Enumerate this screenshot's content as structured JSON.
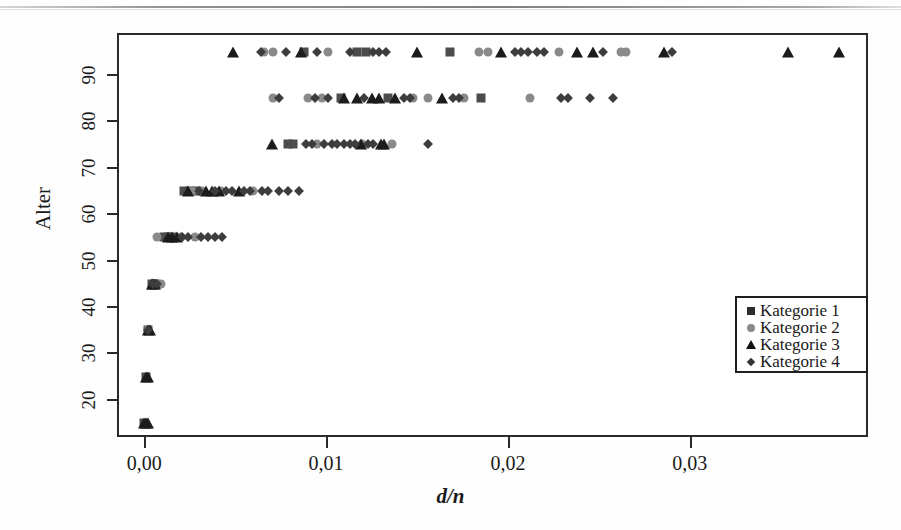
{
  "chart_data": {
    "type": "scatter",
    "title": "",
    "xlabel": "d/n",
    "ylabel": "Alter",
    "xlim": [
      -0.0015,
      0.0398
    ],
    "ylim": [
      12,
      99
    ],
    "grid": false,
    "legend_position": "right-bottom",
    "x_ticks": [
      0.0,
      0.01,
      0.02,
      0.03
    ],
    "x_tick_labels": [
      "0,00",
      "0,01",
      "0,02",
      "0,03"
    ],
    "y_ticks": [
      20,
      30,
      40,
      50,
      60,
      70,
      80,
      90
    ],
    "y_tick_labels": [
      "20",
      "30",
      "40",
      "50",
      "60",
      "70",
      "80",
      "90"
    ],
    "series": [
      {
        "name": "Kategorie 1",
        "marker": "square",
        "color": "#4c4c4c",
        "points": [
          [
            0.0,
            15
          ],
          [
            0.0001,
            25
          ],
          [
            0.0002,
            35
          ],
          [
            0.0004,
            45
          ],
          [
            0.0006,
            45
          ],
          [
            0.0011,
            55
          ],
          [
            0.0013,
            55
          ],
          [
            0.0016,
            55
          ],
          [
            0.0022,
            65
          ],
          [
            0.0025,
            65
          ],
          [
            0.0029,
            65
          ],
          [
            0.0079,
            75
          ],
          [
            0.0082,
            75
          ],
          [
            0.0108,
            85
          ],
          [
            0.0134,
            85
          ],
          [
            0.0185,
            85
          ],
          [
            0.0088,
            95
          ],
          [
            0.0117,
            95
          ],
          [
            0.0122,
            95
          ],
          [
            0.0168,
            95
          ]
        ]
      },
      {
        "name": "Kategorie 2",
        "marker": "circle",
        "color": "#8a8a8a",
        "points": [
          [
            0.0002,
            35
          ],
          [
            0.0007,
            45
          ],
          [
            0.0009,
            45
          ],
          [
            0.0007,
            55
          ],
          [
            0.002,
            55
          ],
          [
            0.0028,
            55
          ],
          [
            0.0026,
            65
          ],
          [
            0.0032,
            65
          ],
          [
            0.0042,
            65
          ],
          [
            0.006,
            65
          ],
          [
            0.0095,
            75
          ],
          [
            0.012,
            75
          ],
          [
            0.0136,
            75
          ],
          [
            0.0071,
            85
          ],
          [
            0.009,
            85
          ],
          [
            0.0098,
            85
          ],
          [
            0.0148,
            85
          ],
          [
            0.0156,
            85
          ],
          [
            0.0176,
            85
          ],
          [
            0.0212,
            85
          ],
          [
            0.0066,
            95
          ],
          [
            0.0071,
            95
          ],
          [
            0.0101,
            95
          ],
          [
            0.0184,
            95
          ],
          [
            0.0189,
            95
          ],
          [
            0.0228,
            95
          ],
          [
            0.0262,
            95
          ],
          [
            0.0265,
            95
          ]
        ]
      },
      {
        "name": "Kategorie 3",
        "marker": "triangle",
        "color": "#1c1c1c",
        "points": [
          [
            0.0,
            15
          ],
          [
            0.0001,
            15
          ],
          [
            0.0002,
            15
          ],
          [
            0.0001,
            25
          ],
          [
            0.0002,
            25
          ],
          [
            0.0002,
            35
          ],
          [
            0.0003,
            35
          ],
          [
            0.0004,
            45
          ],
          [
            0.0005,
            45
          ],
          [
            0.0006,
            45
          ],
          [
            0.0013,
            55
          ],
          [
            0.0015,
            55
          ],
          [
            0.0018,
            55
          ],
          [
            0.0024,
            65
          ],
          [
            0.0034,
            65
          ],
          [
            0.0037,
            65
          ],
          [
            0.0041,
            65
          ],
          [
            0.0052,
            65
          ],
          [
            0.007,
            75
          ],
          [
            0.0119,
            75
          ],
          [
            0.013,
            75
          ],
          [
            0.0132,
            75
          ],
          [
            0.011,
            85
          ],
          [
            0.0117,
            85
          ],
          [
            0.0125,
            85
          ],
          [
            0.0129,
            85
          ],
          [
            0.0138,
            85
          ],
          [
            0.0164,
            85
          ],
          [
            0.0049,
            95
          ],
          [
            0.0086,
            95
          ],
          [
            0.015,
            95
          ],
          [
            0.0196,
            95
          ],
          [
            0.0238,
            95
          ],
          [
            0.0247,
            95
          ],
          [
            0.0286,
            95
          ],
          [
            0.0354,
            95
          ],
          [
            0.0382,
            95
          ]
        ]
      },
      {
        "name": "Kategorie 4",
        "marker": "diamond",
        "color": "#3d3d3d",
        "points": [
          [
            0.0002,
            35
          ],
          [
            0.0005,
            45
          ],
          [
            0.0007,
            45
          ],
          [
            0.0021,
            55
          ],
          [
            0.0024,
            55
          ],
          [
            0.0031,
            55
          ],
          [
            0.0035,
            55
          ],
          [
            0.0039,
            55
          ],
          [
            0.0043,
            55
          ],
          [
            0.003,
            65
          ],
          [
            0.0039,
            65
          ],
          [
            0.0045,
            65
          ],
          [
            0.0048,
            65
          ],
          [
            0.0055,
            65
          ],
          [
            0.0058,
            65
          ],
          [
            0.0065,
            65
          ],
          [
            0.0068,
            65
          ],
          [
            0.0074,
            65
          ],
          [
            0.0079,
            65
          ],
          [
            0.0085,
            65
          ],
          [
            0.0089,
            75
          ],
          [
            0.0092,
            75
          ],
          [
            0.0099,
            75
          ],
          [
            0.0103,
            75
          ],
          [
            0.0106,
            75
          ],
          [
            0.011,
            75
          ],
          [
            0.0113,
            75
          ],
          [
            0.0116,
            75
          ],
          [
            0.0123,
            75
          ],
          [
            0.0126,
            75
          ],
          [
            0.0156,
            75
          ],
          [
            0.0074,
            85
          ],
          [
            0.0094,
            85
          ],
          [
            0.0101,
            85
          ],
          [
            0.0121,
            85
          ],
          [
            0.0143,
            85
          ],
          [
            0.0146,
            85
          ],
          [
            0.017,
            85
          ],
          [
            0.0173,
            85
          ],
          [
            0.0229,
            85
          ],
          [
            0.0233,
            85
          ],
          [
            0.0245,
            85
          ],
          [
            0.0258,
            85
          ],
          [
            0.0064,
            95
          ],
          [
            0.0078,
            95
          ],
          [
            0.0095,
            95
          ],
          [
            0.0113,
            95
          ],
          [
            0.0126,
            95
          ],
          [
            0.0129,
            95
          ],
          [
            0.0133,
            95
          ],
          [
            0.0204,
            95
          ],
          [
            0.0207,
            95
          ],
          [
            0.0211,
            95
          ],
          [
            0.0216,
            95
          ],
          [
            0.022,
            95
          ],
          [
            0.0252,
            95
          ],
          [
            0.029,
            95
          ]
        ]
      }
    ]
  },
  "legend": {
    "items": [
      {
        "label": "Kategorie 1",
        "marker": "square"
      },
      {
        "label": "Kategorie 2",
        "marker": "circle"
      },
      {
        "label": "Kategorie 3",
        "marker": "triangle"
      },
      {
        "label": "Kategorie 4",
        "marker": "diamond"
      }
    ]
  }
}
